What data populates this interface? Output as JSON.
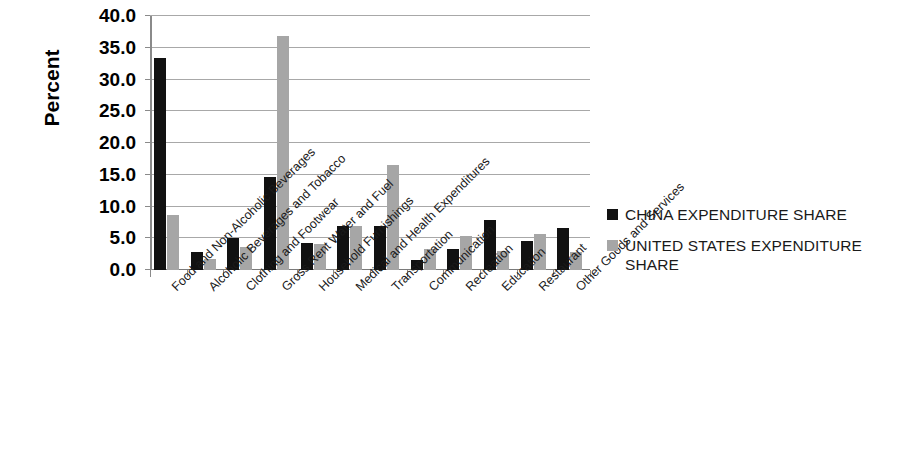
{
  "chart_data": {
    "type": "bar",
    "title": "",
    "subtitle": "",
    "xlabel": "",
    "ylabel": "Percent",
    "ylim": [
      0,
      40
    ],
    "ytick_step": 5,
    "ytick_labels": [
      "40.0",
      "35.0",
      "30.0",
      "25.0",
      "20.0",
      "15.0",
      "10.0",
      "5.0",
      "0.0"
    ],
    "grid": true,
    "legend_position": "right",
    "categories": [
      "Food and Non-Alcoholic Beverages",
      "Alcoholic Beverages and Tobacco",
      "Clothing and Footwear",
      "Gross Rent Water and Fuel",
      "Household Furnishings",
      "Medical and Health Expenditures",
      "Transportation",
      "Communication",
      "Recreation",
      "Education",
      "Restaurant",
      "Other Goods and Services"
    ],
    "series": [
      {
        "name": "CHINA EXPENDITURE SHARE",
        "color": "#111111",
        "values": [
          33.4,
          2.8,
          5.0,
          14.6,
          4.2,
          7.0,
          6.9,
          1.6,
          3.3,
          7.9,
          4.6,
          6.6
        ]
      },
      {
        "name": "UNITED STATES EXPENDITURE SHARE",
        "color": "#a6a6a6",
        "values": [
          8.7,
          1.8,
          3.7,
          36.9,
          4.1,
          7.0,
          16.5,
          3.3,
          5.3,
          3.0,
          5.7,
          2.8
        ]
      }
    ]
  },
  "legend": {
    "items": [
      {
        "label": "CHINA EXPENDITURE SHARE",
        "color": "#111111"
      },
      {
        "label": "UNITED STATES EXPENDITURE SHARE",
        "color": "#a6a6a6"
      }
    ]
  }
}
